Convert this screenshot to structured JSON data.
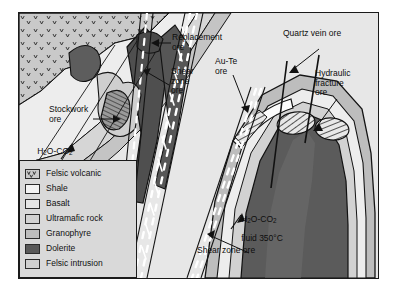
{
  "figure": {
    "type": "geological cross-section diagram",
    "background_color": "#ffffff",
    "frame_fill": "#d9d9d9",
    "frame_border": "#1a1a1a"
  },
  "legend": {
    "items": [
      {
        "label": "Felsic volcanic",
        "color": "#c9c9c9",
        "pattern": "v-marks"
      },
      {
        "label": "Shale",
        "color": "#f2f2f2",
        "pattern": "solid"
      },
      {
        "label": "Basalt",
        "color": "#e4e4e4",
        "pattern": "solid"
      },
      {
        "label": "Ultramafic rock",
        "color": "#d2d2d2",
        "pattern": "solid"
      },
      {
        "label": "Granophyre",
        "color": "#bdbdbd",
        "pattern": "solid"
      },
      {
        "label": "Dolerite",
        "color": "#595959",
        "pattern": "solid"
      },
      {
        "label": "Felsic intrusion",
        "color": "#cfcfcf",
        "pattern": "solid"
      }
    ]
  },
  "annotations": [
    {
      "id": "replacement-ore",
      "text": "Replacement\nore"
    },
    {
      "id": "shear-zone-ore-upper",
      "text": "Shear\nzone\nore"
    },
    {
      "id": "au-te-ore",
      "text": "Au-Te\nore"
    },
    {
      "id": "quartz-vein-ore",
      "text": "Quartz vein ore"
    },
    {
      "id": "hydraulic-fracture-ore",
      "text": "Hydraulic\nfracture\nore"
    },
    {
      "id": "stockwork-ore",
      "text": "Stockwork\nore"
    },
    {
      "id": "shear-zone-ore-lower",
      "text": "Shear zone ore"
    }
  ],
  "fluid_labels": {
    "left": {
      "formula_pre": "H",
      "sub1": "2",
      "formula_mid": "O-CO",
      "sub2": "2",
      "line2": "fluid",
      "line3": "350°C"
    },
    "right": {
      "formula_pre": "H",
      "sub1": "2",
      "formula_mid": "O-CO",
      "sub2": "2",
      "line2": "fluid 350°C"
    }
  }
}
